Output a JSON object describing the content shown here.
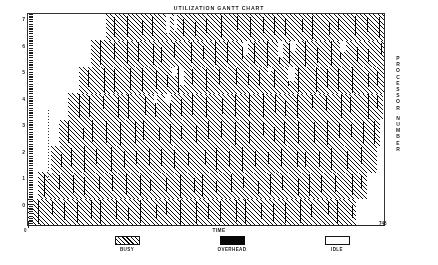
{
  "chart_data": {
    "type": "bar",
    "title": "UTILIZATION GANTT CHART",
    "subtitle": "",
    "xlabel": "TIME",
    "ylabel": "PROCESSOR NUMBER",
    "xlim": [
      0,
      748
    ],
    "ylim": [
      0,
      7
    ],
    "grid": false,
    "legend_position": "bottom",
    "x_tick_labels": [
      "0",
      "748"
    ],
    "y_tick_labels": [
      "7",
      "6",
      "5",
      "4",
      "3",
      "2",
      "1",
      "0"
    ],
    "categories": [
      "0",
      "1",
      "2",
      "3",
      "4",
      "5",
      "6",
      "7"
    ],
    "series": [
      {
        "name": "BUSY",
        "pattern": "diagonal-hatch",
        "color": "#151515"
      },
      {
        "name": "OVERHEAD",
        "pattern": "solid",
        "color": "#101010"
      },
      {
        "name": "IDLE",
        "pattern": "empty",
        "color": "#ffffff"
      }
    ],
    "rows": [
      {
        "processor": "0",
        "busy_start": 0,
        "busy_end": 690
      },
      {
        "processor": "1",
        "busy_start": 20,
        "busy_end": 712
      },
      {
        "processor": "2",
        "busy_start": 48,
        "busy_end": 733
      },
      {
        "processor": "3",
        "busy_start": 66,
        "busy_end": 740
      },
      {
        "processor": "4",
        "busy_start": 84,
        "busy_end": 745
      },
      {
        "processor": "5",
        "busy_start": 108,
        "busy_end": 748
      },
      {
        "processor": "6",
        "busy_start": 132,
        "busy_end": 748
      },
      {
        "processor": "7",
        "busy_start": 164,
        "busy_end": 748
      }
    ]
  },
  "chart": {
    "title": "UTILIZATION GANTT CHART",
    "x_axis": {
      "label": "TIME",
      "start_tick": "0",
      "end_tick": "748"
    },
    "y_axis": {
      "label_letters": [
        "P",
        "R",
        "O",
        "C",
        "E",
        "S",
        "S",
        "O",
        "R",
        "N",
        "U",
        "M",
        "B",
        "E",
        "R"
      ],
      "ticks": [
        "7",
        "6",
        "5",
        "4",
        "3",
        "2",
        "1",
        "0"
      ]
    }
  },
  "legend": {
    "items": [
      {
        "label": "BUSY",
        "swatch": "hatch"
      },
      {
        "label": "OVERHEAD",
        "swatch": "solid"
      },
      {
        "label": "IDLE",
        "swatch": "empty"
      }
    ]
  }
}
